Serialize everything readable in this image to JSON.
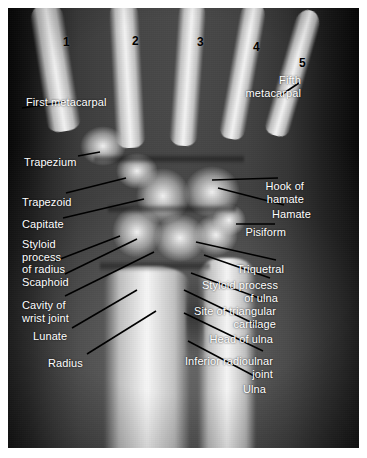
{
  "figure": {
    "background_color": "#ffffff",
    "plate_color": "#0b0b0b",
    "label_color": "#ffffff",
    "number_color": "#000000",
    "leader_color": "#000000"
  },
  "metacarpal_numbers": [
    {
      "id": "mc1",
      "text": "1",
      "x": 55,
      "y": 28
    },
    {
      "id": "mc2",
      "text": "2",
      "x": 124,
      "y": 27
    },
    {
      "id": "mc3",
      "text": "3",
      "x": 189,
      "y": 28
    },
    {
      "id": "mc4",
      "text": "4",
      "x": 245,
      "y": 33
    },
    {
      "id": "mc5",
      "text": "5",
      "x": 291,
      "y": 49
    }
  ],
  "labels_left": [
    {
      "id": "first-metacarpal",
      "lines": [
        "First metacarpal"
      ],
      "x": 18,
      "y": 88
    },
    {
      "id": "trapezium",
      "lines": [
        "Trapezium"
      ],
      "x": 16,
      "y": 148
    },
    {
      "id": "trapezoid",
      "lines": [
        "Trapezoid"
      ],
      "x": 14,
      "y": 188
    },
    {
      "id": "capitate",
      "lines": [
        "Capitate"
      ],
      "x": 14,
      "y": 210
    },
    {
      "id": "styloid-process-of-radius",
      "lines": [
        "Styloid",
        "process",
        "of radius"
      ],
      "x": 14,
      "y": 230
    },
    {
      "id": "scaphoid",
      "lines": [
        "Scaphoid"
      ],
      "x": 14,
      "y": 268
    },
    {
      "id": "cavity-of-wrist-joint",
      "lines": [
        "Cavity of",
        "wrist joint"
      ],
      "x": 14,
      "y": 291
    },
    {
      "id": "lunate",
      "lines": [
        "Lunate"
      ],
      "x": 25,
      "y": 322
    },
    {
      "id": "radius",
      "lines": [
        "Radius"
      ],
      "x": 40,
      "y": 349
    }
  ],
  "labels_right": [
    {
      "id": "fifth-metacarpal",
      "lines": [
        "Fifth",
        "metacarpal"
      ],
      "x": 293,
      "y": 66
    },
    {
      "id": "hook-of-hamate",
      "lines": [
        "Hook of",
        "hamate"
      ],
      "x": 296,
      "y": 172
    },
    {
      "id": "hamate",
      "lines": [
        "Hamate"
      ],
      "x": 303,
      "y": 200
    },
    {
      "id": "pisiform",
      "lines": [
        "Pisiform"
      ],
      "x": 278,
      "y": 218
    },
    {
      "id": "triquetral",
      "lines": [
        "Triquetral"
      ],
      "x": 276,
      "y": 255
    },
    {
      "id": "styloid-process-of-ulna",
      "lines": [
        "Styloid process",
        "of ulna"
      ],
      "x": 270,
      "y": 271
    },
    {
      "id": "site-of-triangular-cartilage",
      "lines": [
        "Site of triangular",
        "cartilage"
      ],
      "x": 268,
      "y": 297
    },
    {
      "id": "head-of-ulna",
      "lines": [
        "Head of ulna"
      ],
      "x": 265,
      "y": 325
    },
    {
      "id": "inferior-radioulnar-joint",
      "lines": [
        "Inferior radioulnar",
        "joint"
      ],
      "x": 265,
      "y": 347
    },
    {
      "id": "ulna",
      "lines": [
        "Ulna"
      ],
      "x": 258,
      "y": 375
    }
  ],
  "leader_lines": [
    {
      "id": "leader-first-metacarpal",
      "x1": 14,
      "y1": 100,
      "x2": 56,
      "y2": 94
    },
    {
      "id": "leader-fifth-metacarpal",
      "x1": 270,
      "y1": 89,
      "x2": 291,
      "y2": 75
    },
    {
      "id": "leader-trapezium",
      "x1": 70,
      "y1": 148,
      "x2": 92,
      "y2": 144
    },
    {
      "id": "leader-trapezoid",
      "x1": 58,
      "y1": 185,
      "x2": 118,
      "y2": 170
    },
    {
      "id": "leader-capitate",
      "x1": 55,
      "y1": 210,
      "x2": 136,
      "y2": 191
    },
    {
      "id": "leader-styloid-radius",
      "x1": 47,
      "y1": 253,
      "x2": 112,
      "y2": 228
    },
    {
      "id": "leader-scaphoid",
      "x1": 57,
      "y1": 266,
      "x2": 129,
      "y2": 231
    },
    {
      "id": "leader-cavity-wrist",
      "x1": 57,
      "y1": 288,
      "x2": 146,
      "y2": 244
    },
    {
      "id": "leader-lunate",
      "x1": 64,
      "y1": 320,
      "x2": 129,
      "y2": 282
    },
    {
      "id": "leader-radius",
      "x1": 79,
      "y1": 346,
      "x2": 148,
      "y2": 303
    },
    {
      "id": "leader-hook-of-hamate",
      "x1": 204,
      "y1": 172,
      "x2": 270,
      "y2": 170
    },
    {
      "id": "leader-hamate",
      "x1": 210,
      "y1": 180,
      "x2": 276,
      "y2": 197
    },
    {
      "id": "leader-pisiform",
      "x1": 228,
      "y1": 216,
      "x2": 267,
      "y2": 216
    },
    {
      "id": "leader-triquetral",
      "x1": 188,
      "y1": 234,
      "x2": 268,
      "y2": 252
    },
    {
      "id": "leader-styloid-ulna",
      "x1": 196,
      "y1": 247,
      "x2": 262,
      "y2": 270
    },
    {
      "id": "leader-triangular-cartilage",
      "x1": 183,
      "y1": 265,
      "x2": 259,
      "y2": 293
    },
    {
      "id": "leader-head-of-ulna",
      "x1": 176,
      "y1": 282,
      "x2": 255,
      "y2": 320
    },
    {
      "id": "leader-inferior-radioulnar",
      "x1": 176,
      "y1": 305,
      "x2": 255,
      "y2": 343
    },
    {
      "id": "leader-ulna",
      "x1": 180,
      "y1": 333,
      "x2": 250,
      "y2": 370
    }
  ],
  "anatomy_shapes": {
    "metacarpals": [
      {
        "id": "metacarpal-1",
        "left": 30,
        "top": -6,
        "width": 34,
        "height": 130,
        "rotate": -9
      },
      {
        "id": "metacarpal-2",
        "left": 104,
        "top": -10,
        "width": 30,
        "height": 150,
        "rotate": -3
      },
      {
        "id": "metacarpal-3",
        "left": 166,
        "top": -10,
        "width": 28,
        "height": 148,
        "rotate": 4
      },
      {
        "id": "metacarpal-4",
        "left": 222,
        "top": -8,
        "width": 26,
        "height": 140,
        "rotate": 10
      },
      {
        "id": "metacarpal-5",
        "left": 272,
        "top": 0,
        "width": 26,
        "height": 130,
        "rotate": 16
      }
    ],
    "carpals": [
      {
        "id": "carpal-trapezium",
        "left": 72,
        "top": 118,
        "width": 46,
        "height": 40
      },
      {
        "id": "carpal-trapezoid",
        "left": 108,
        "top": 145,
        "width": 42,
        "height": 36
      },
      {
        "id": "carpal-capitate",
        "left": 128,
        "top": 160,
        "width": 54,
        "height": 56
      },
      {
        "id": "carpal-hamate",
        "left": 176,
        "top": 158,
        "width": 56,
        "height": 52
      },
      {
        "id": "carpal-scaphoid",
        "left": 104,
        "top": 198,
        "width": 50,
        "height": 52
      },
      {
        "id": "carpal-lunate",
        "left": 146,
        "top": 206,
        "width": 52,
        "height": 48
      },
      {
        "id": "carpal-triquetral",
        "left": 186,
        "top": 206,
        "width": 44,
        "height": 42
      },
      {
        "id": "carpal-pisiform",
        "left": 204,
        "top": 196,
        "width": 34,
        "height": 32
      }
    ],
    "forearm": [
      {
        "id": "radius-shaft",
        "left": 96,
        "top": 258,
        "width": 86,
        "height": 190
      },
      {
        "id": "ulna-shaft",
        "left": 190,
        "top": 250,
        "width": 58,
        "height": 198
      }
    ],
    "joints": [
      {
        "id": "radiocarpal-joint-line",
        "left": 92,
        "top": 252,
        "width": 110,
        "height": 12
      },
      {
        "id": "midcarpal-joint-line",
        "left": 100,
        "top": 196,
        "width": 128,
        "height": 10
      },
      {
        "id": "carpometacarpal-joint-line",
        "left": 86,
        "top": 146,
        "width": 150,
        "height": 10
      },
      {
        "id": "inferior-radioulnar-joint-line",
        "left": 178,
        "top": 262,
        "width": 18,
        "height": 96
      }
    ]
  }
}
